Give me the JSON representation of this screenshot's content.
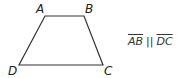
{
  "diagram": {
    "shape": "trapezoid",
    "vertices": [
      {
        "label": "A",
        "x": 45,
        "y": 16
      },
      {
        "label": "B",
        "x": 84,
        "y": 16
      },
      {
        "label": "C",
        "x": 103,
        "y": 65
      },
      {
        "label": "D",
        "x": 19,
        "y": 65
      }
    ],
    "stroke_color": "#333333"
  },
  "labels": {
    "a": "A",
    "b": "B",
    "c": "C",
    "d": "D"
  },
  "relation": {
    "left": "AB",
    "symbol": "||",
    "right": "DC"
  }
}
